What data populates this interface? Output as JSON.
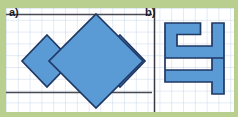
{
  "page": {
    "width": 238,
    "height": 117,
    "border_color": "#b9cf8f",
    "paper_color": "#ffffff",
    "grid_line_color": "#c3d4e8",
    "rule_color": "#4a4a52",
    "shape_fill": "#5b9bd5",
    "shape_stroke": "#1f3864"
  },
  "panels": [
    {
      "id": "a",
      "label": "a)",
      "figure": "three-rotated-squares",
      "description": "Three blue rotated squares (diamonds) in a row between two horizontal rules",
      "shapes": [
        {
          "name": "diamond-left",
          "points": "47,35 72,61 47,87 22,61"
        },
        {
          "name": "diamond-center",
          "points": "96,14 143,61 96,108 49,61"
        },
        {
          "name": "diamond-right",
          "points": "120,35 145,61 120,87 95,61"
        }
      ],
      "rules": [
        {
          "name": "rule-top",
          "x1": 6,
          "y1": 14,
          "x2": 152,
          "y2": 14
        },
        {
          "name": "rule-bottom",
          "x1": 6,
          "y1": 92,
          "x2": 152,
          "y2": 92
        }
      ]
    },
    {
      "id": "b",
      "label": "b)",
      "figure": "zigzag-polygon",
      "description": "Blue maze-like zigzag polygon built from grid-aligned segments",
      "shapes": [
        {
          "name": "zigzag-polygon",
          "points": "155,17 190,17 190,29 167,29 167,41 202,41 202,17 214,17 214,65 155,65 155,77 190,77 190,89 202,89 202,77 214,77 214,89 214,89 202,101 190,101 190,89 155,89 155,77 143,77 143,65 143,17"
        }
      ],
      "rules": [
        {
          "name": "rule-divider",
          "x1": 154,
          "y1": 8,
          "x2": 154,
          "y2": 104
        },
        {
          "name": "rule-tick-top",
          "x1": 0,
          "y1": 14,
          "x2": 6,
          "y2": 14
        },
        {
          "name": "rule-tick-bottom",
          "x1": 0,
          "y1": 92,
          "x2": 6,
          "y2": 92
        }
      ]
    }
  ],
  "grid": {
    "cell": 11.8,
    "visible": true
  }
}
